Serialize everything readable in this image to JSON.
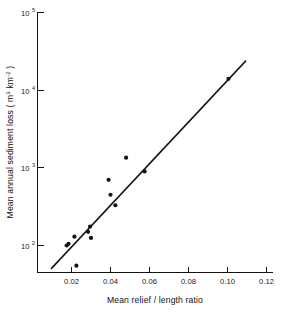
{
  "chart_data": {
    "type": "scatter",
    "title": "",
    "xlabel": "Mean relief / length ratio",
    "ylabel_parts": {
      "main": "Mean annual sediment loss ( m",
      "sup1": "3",
      "mid": " km",
      "sup2": "-2",
      "tail": " )"
    },
    "ylabel": "Mean annual sediment loss (m3 km-2)",
    "xlim": [
      0.0,
      0.12
    ],
    "ylim": [
      30,
      100000
    ],
    "yscale": "log",
    "xscale": "linear",
    "grid": false,
    "legend": null,
    "xticks": [
      0.02,
      0.04,
      0.06,
      0.08,
      0.1,
      0.12
    ],
    "xtick_labels": [
      "0.02",
      "0.04",
      "0.06",
      "0.08",
      "0.10",
      "0.12"
    ],
    "yticks": [
      100,
      1000,
      10000,
      100000
    ],
    "ytick_labels": [
      "10^2",
      "10^3",
      "10^4",
      "10^5"
    ],
    "ytick_mantissa": [
      "10",
      "10",
      "10",
      "10"
    ],
    "ytick_exponent": [
      "2",
      "3",
      "4",
      "5"
    ],
    "points": [
      {
        "x": 0.0175,
        "y": 100
      },
      {
        "x": 0.0185,
        "y": 105
      },
      {
        "x": 0.0215,
        "y": 130
      },
      {
        "x": 0.0225,
        "y": 55
      },
      {
        "x": 0.0285,
        "y": 150
      },
      {
        "x": 0.0295,
        "y": 175
      },
      {
        "x": 0.03,
        "y": 125
      },
      {
        "x": 0.039,
        "y": 700
      },
      {
        "x": 0.04,
        "y": 450
      },
      {
        "x": 0.0425,
        "y": 330
      },
      {
        "x": 0.048,
        "y": 1350
      },
      {
        "x": 0.0575,
        "y": 900
      },
      {
        "x": 0.1005,
        "y": 14000
      }
    ],
    "fit_line": {
      "label": "regression line",
      "x_start": 0.0095,
      "y_start": 50,
      "x_end": 0.1095,
      "y_end": 24000
    },
    "series": [
      {
        "name": "sediment loss vs relief ratio",
        "x": [
          0.0175,
          0.0185,
          0.0215,
          0.0225,
          0.0285,
          0.0295,
          0.03,
          0.039,
          0.04,
          0.0425,
          0.048,
          0.0575,
          0.1005
        ],
        "values": [
          100,
          105,
          130,
          55,
          150,
          175,
          125,
          700,
          450,
          330,
          1350,
          900,
          14000
        ]
      }
    ]
  }
}
